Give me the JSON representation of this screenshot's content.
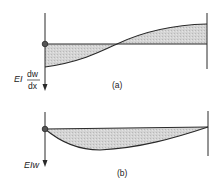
{
  "diagram": {
    "panel_a": {
      "caption": "(a)",
      "axis_label_prefix": "EI",
      "axis_label_num": "dw",
      "axis_label_den": "dx",
      "description": "Slope distribution along beam: negative near left support, crossing zero near midspan, positive toward right support"
    },
    "panel_b": {
      "caption": "(b)",
      "axis_label": "EIw",
      "description": "Deflection distribution along beam: zero at both supports, maximum sag left of midspan"
    },
    "colors": {
      "line": "#2a2a2a",
      "fill": "#cfcfcf"
    }
  }
}
